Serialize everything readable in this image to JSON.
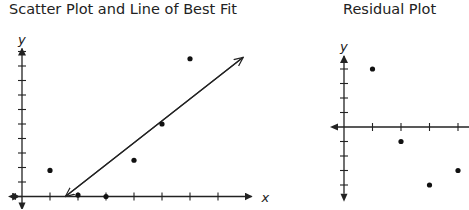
{
  "chart_data": [
    {
      "type": "scatter",
      "title": "Scatter Plot and Line of Best Fit",
      "xlabel": "x",
      "ylabel": "y",
      "grid": false,
      "x_ticks": [
        1,
        2,
        3,
        4,
        5,
        6,
        7
      ],
      "y_ticks": [
        1,
        2,
        3,
        4,
        5,
        6,
        7,
        8,
        9,
        10
      ],
      "xlim": [
        0,
        8
      ],
      "ylim": [
        0,
        10
      ],
      "points": [
        {
          "x": 1,
          "y": 1.8
        },
        {
          "x": 2,
          "y": 0.1
        },
        {
          "x": 3,
          "y": 0
        },
        {
          "x": 4,
          "y": 2.5
        },
        {
          "x": 5,
          "y": 5
        },
        {
          "x": 6,
          "y": 9.5
        }
      ],
      "line_of_best_fit": {
        "x1": 1.55,
        "y1": 0,
        "x2": 7.9,
        "y2": 9.6
      }
    },
    {
      "type": "scatter",
      "title": "Residual Plot",
      "xlabel": "",
      "ylabel": "y",
      "grid": false,
      "x_ticks": [
        1,
        2,
        3,
        4
      ],
      "y_ticks": [
        -4,
        -3,
        -2,
        -1,
        1,
        2,
        3,
        4
      ],
      "xlim": [
        0,
        4.5
      ],
      "ylim": [
        -4.5,
        4.5
      ],
      "points": [
        {
          "x": 1,
          "y": 4
        },
        {
          "x": 2,
          "y": -1
        },
        {
          "x": 3,
          "y": -4
        },
        {
          "x": 4,
          "y": -3
        }
      ]
    }
  ]
}
